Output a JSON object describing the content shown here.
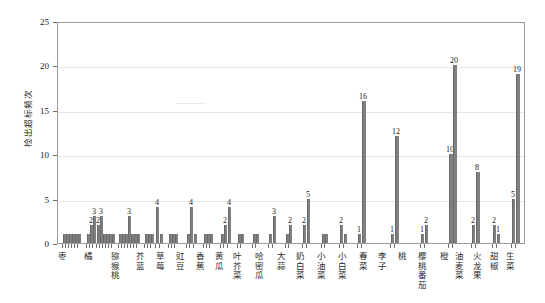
{
  "chart_data": {
    "type": "bar",
    "title": "",
    "xlabel": "",
    "ylabel": "检出超标频次",
    "ylim": [
      0,
      25
    ],
    "yticks": [
      0,
      5,
      10,
      15,
      20,
      25
    ],
    "grid": true,
    "legend": "none",
    "categories": [
      "枣",
      "橘",
      "猕猴桃",
      "芥蓝",
      "草莓",
      "豇豆",
      "香蕉",
      "黄瓜",
      "叶芥菜",
      "哈密瓜",
      "大蒜",
      "奶白菜",
      "小油菜",
      "小白菜",
      "春菜",
      "李子",
      "桃",
      "樱桃番茄",
      "橙",
      "油麦菜",
      "火龙果",
      "甜椒",
      "生菜"
    ],
    "groups": [
      {
        "name": "枣",
        "values": [
          1,
          1,
          1,
          1,
          1,
          1
        ]
      },
      {
        "name": "橘",
        "values": [
          1,
          2,
          3,
          2,
          3,
          1,
          1,
          1,
          1
        ]
      },
      {
        "name": "猕猴桃",
        "values": [
          1,
          1,
          1,
          3,
          1,
          1,
          1
        ]
      },
      {
        "name": "芥蓝",
        "values": [
          1,
          1,
          1,
          4,
          1
        ]
      },
      {
        "name": "草莓",
        "values": [
          1,
          1,
          1
        ]
      },
      {
        "name": "豇豆",
        "values": [
          1,
          1,
          1,
          4,
          1
        ]
      },
      {
        "name": "香蕉",
        "values": [
          1,
          1,
          1
        ]
      },
      {
        "name": "黄瓜",
        "values": [
          1,
          1,
          2,
          3
        ]
      },
      {
        "name": "叶芥菜",
        "values": [
          1,
          1,
          2
        ]
      },
      {
        "name": "哈密瓜",
        "values": [
          1,
          1,
          4,
          2
        ]
      },
      {
        "name": "大蒜",
        "values": [
          1,
          1
        ]
      },
      {
        "name": "奶白菜",
        "values": [
          1,
          1,
          3
        ]
      },
      {
        "name": "小油菜",
        "values": [
          1,
          2
        ]
      },
      {
        "name": "小白菜",
        "values": [
          2,
          5
        ]
      },
      {
        "name": "春菜",
        "values": [
          1,
          1
        ]
      },
      {
        "name": "李子",
        "values": [
          1,
          2
        ]
      },
      {
        "name": "桃",
        "values": [
          1,
          16
        ]
      },
      {
        "name": "樱桃番茄",
        "values": [
          1,
          12
        ]
      },
      {
        "name": "橙",
        "values": [
          1,
          2
        ]
      },
      {
        "name": "油麦菜",
        "values": [
          10,
          20
        ]
      },
      {
        "name": "火龙果",
        "values": [
          2,
          8
        ]
      },
      {
        "name": "甜椒",
        "values": [
          2,
          1
        ]
      },
      {
        "name": "生菜",
        "values": [
          5,
          19
        ]
      }
    ],
    "value_labels": [
      {
        "group": "橘",
        "value": 2
      },
      {
        "group": "橘",
        "value": 3
      },
      {
        "group": "橘",
        "value": 2
      },
      {
        "group": "橘",
        "value": 3
      },
      {
        "group": "猕猴桃",
        "value": 3
      },
      {
        "group": "芥蓝",
        "value": 4
      },
      {
        "group": "芥蓝",
        "value": 6
      },
      {
        "group": "豇豆",
        "value": 4
      },
      {
        "group": "黄瓜",
        "value": 2
      },
      {
        "group": "黄瓜",
        "value": 4
      },
      {
        "group": "哈密瓜",
        "value": 4
      },
      {
        "group": "奶白菜",
        "value": 3
      },
      {
        "group": "小油菜",
        "value": 2
      },
      {
        "group": "小白菜",
        "value": 2
      },
      {
        "group": "小白菜",
        "value": 5
      },
      {
        "group": "李子",
        "value": 2
      },
      {
        "group": "桃",
        "value": 1
      },
      {
        "group": "桃",
        "value": 16
      },
      {
        "group": "樱桃番茄",
        "value": 1
      },
      {
        "group": "樱桃番茄",
        "value": 12
      },
      {
        "group": "橙",
        "value": 1
      },
      {
        "group": "橙",
        "value": 2
      },
      {
        "group": "油麦菜",
        "value": 10
      },
      {
        "group": "油麦菜",
        "value": 20
      },
      {
        "group": "火龙果",
        "value": 2
      },
      {
        "group": "火龙果",
        "value": 8
      },
      {
        "group": "甜椒",
        "value": 2
      },
      {
        "group": "甜椒",
        "value": 1
      },
      {
        "group": "生菜",
        "value": 5
      },
      {
        "group": "生菜",
        "value": 19
      }
    ],
    "colors": {
      "bar": "#808080",
      "grid": "#e6e6e6",
      "axis": "#9b9b9b",
      "text": "#1a1a1a"
    }
  },
  "axis": {
    "y": {
      "ticks": [
        "0",
        "5",
        "10",
        "15",
        "20",
        "25"
      ],
      "title": "检出超标频次"
    }
  },
  "bars": [
    {
      "g": 0,
      "x": 62,
      "v": 1
    },
    {
      "g": 0,
      "x": 65,
      "v": 1
    },
    {
      "g": 0,
      "x": 68,
      "v": 1
    },
    {
      "g": 0,
      "x": 71,
      "v": 1
    },
    {
      "g": 0,
      "x": 74,
      "v": 1
    },
    {
      "g": 0,
      "x": 77,
      "v": 1
    },
    {
      "g": 1,
      "x": 86,
      "v": 1
    },
    {
      "g": 1,
      "x": 89,
      "v": 2,
      "lab": "2"
    },
    {
      "g": 1,
      "x": 92,
      "v": 3,
      "lab": "3"
    },
    {
      "g": 1,
      "x": 96,
      "v": 2,
      "lab": "2"
    },
    {
      "g": 1,
      "x": 99,
      "v": 3,
      "lab": "3"
    },
    {
      "g": 1,
      "x": 102,
      "v": 1
    },
    {
      "g": 1,
      "x": 105,
      "v": 1
    },
    {
      "g": 1,
      "x": 108,
      "v": 1
    },
    {
      "g": 1,
      "x": 111,
      "v": 1
    },
    {
      "g": 2,
      "x": 118,
      "v": 1
    },
    {
      "g": 2,
      "x": 121,
      "v": 1
    },
    {
      "g": 2,
      "x": 124,
      "v": 1
    },
    {
      "g": 2,
      "x": 127,
      "v": 3,
      "lab": "3"
    },
    {
      "g": 2,
      "x": 130,
      "v": 1
    },
    {
      "g": 2,
      "x": 133,
      "v": 1
    },
    {
      "g": 2,
      "x": 136,
      "v": 1
    },
    {
      "g": 3,
      "x": 144,
      "v": 1
    },
    {
      "g": 3,
      "x": 147,
      "v": 1
    },
    {
      "g": 3,
      "x": 150,
      "v": 1
    },
    {
      "g": 3,
      "x": 155,
      "v": 4,
      "lab": "4"
    },
    {
      "g": 3,
      "x": 159,
      "v": 1
    },
    {
      "g": 4,
      "x": 168,
      "v": 1
    },
    {
      "g": 4,
      "x": 171,
      "v": 1
    },
    {
      "g": 4,
      "x": 174,
      "v": 1
    },
    {
      "g": 5,
      "x": 186,
      "v": 1
    },
    {
      "g": 5,
      "x": 189,
      "v": 4,
      "lab": "4"
    },
    {
      "g": 5,
      "x": 193,
      "v": 1
    },
    {
      "g": 6,
      "x": 203,
      "v": 1
    },
    {
      "g": 6,
      "x": 206,
      "v": 1
    },
    {
      "g": 6,
      "x": 209,
      "v": 1
    },
    {
      "g": 7,
      "x": 220,
      "v": 1
    },
    {
      "g": 7,
      "x": 223,
      "v": 2,
      "lab": "2"
    },
    {
      "g": 7,
      "x": 227,
      "v": 4,
      "lab": "4"
    },
    {
      "g": 8,
      "x": 237,
      "v": 1
    },
    {
      "g": 8,
      "x": 240,
      "v": 1
    },
    {
      "g": 9,
      "x": 252,
      "v": 1
    },
    {
      "g": 9,
      "x": 255,
      "v": 1
    },
    {
      "g": 10,
      "x": 268,
      "v": 1
    },
    {
      "g": 10,
      "x": 272,
      "v": 3,
      "lab": "3"
    },
    {
      "g": 11,
      "x": 285,
      "v": 1
    },
    {
      "g": 11,
      "x": 288,
      "v": 2,
      "lab": "2"
    },
    {
      "g": 12,
      "x": 302,
      "v": 2,
      "lab": "2"
    },
    {
      "g": 12,
      "x": 306,
      "v": 5,
      "lab": "5"
    },
    {
      "g": 13,
      "x": 321,
      "v": 1
    },
    {
      "g": 13,
      "x": 324,
      "v": 1
    },
    {
      "g": 14,
      "x": 339,
      "v": 2,
      "lab": "2"
    },
    {
      "g": 14,
      "x": 343,
      "v": 1
    },
    {
      "g": 15,
      "x": 357,
      "v": 1,
      "lab": "1"
    },
    {
      "g": 15,
      "x": 361,
      "v": 16,
      "lab": "16"
    },
    {
      "g": 16,
      "x": 390,
      "v": 1,
      "lab": "1"
    },
    {
      "g": 16,
      "x": 394,
      "v": 12,
      "lab": "12"
    },
    {
      "g": 17,
      "x": 420,
      "v": 1,
      "lab": "1"
    },
    {
      "g": 17,
      "x": 424,
      "v": 2,
      "lab": "2"
    },
    {
      "g": 18,
      "x": 448,
      "v": 10,
      "lab": "10"
    },
    {
      "g": 18,
      "x": 452,
      "v": 20,
      "lab": "20"
    },
    {
      "g": 19,
      "x": 471,
      "v": 2,
      "lab": "2"
    },
    {
      "g": 19,
      "x": 475,
      "v": 8,
      "lab": "8"
    },
    {
      "g": 20,
      "x": 492,
      "v": 2,
      "lab": "2"
    },
    {
      "g": 20,
      "x": 496,
      "v": 1,
      "lab": "1"
    },
    {
      "g": 21,
      "x": 511,
      "v": 5,
      "lab": "5"
    },
    {
      "g": 21,
      "x": 515,
      "v": 19,
      "lab": "19"
    }
  ],
  "xlabels": [
    {
      "t": "枣",
      "x": 63
    },
    {
      "t": "橘",
      "x": 92
    },
    {
      "t": "猕猴桃",
      "x": 122
    },
    {
      "t": "芥蓝",
      "x": 150
    },
    {
      "t": "草莓",
      "x": 172
    },
    {
      "t": "豇豆",
      "x": 194
    },
    {
      "t": "香蕉",
      "x": 216
    },
    {
      "t": "黄瓜",
      "x": 237
    },
    {
      "t": "叶芥菜",
      "x": 258
    },
    {
      "t": "哈密瓜",
      "x": 282
    },
    {
      "t": "大蒜",
      "x": 306
    },
    {
      "t": "奶白菜",
      "x": 328
    },
    {
      "t": "小油菜",
      "x": 351
    },
    {
      "t": "小白菜",
      "x": 374
    },
    {
      "t": "春菜",
      "x": 397
    },
    {
      "t": "李子",
      "x": 419
    },
    {
      "t": "桃",
      "x": 441
    },
    {
      "t": "樱桃番茄",
      "x": 463
    },
    {
      "t": "橙",
      "x": 487
    },
    {
      "t": "油麦菜",
      "x": 504
    },
    {
      "t": "火龙果",
      "x": 524
    },
    {
      "t": "甜椒",
      "x": 543
    },
    {
      "t": "生菜",
      "x": 561
    }
  ]
}
